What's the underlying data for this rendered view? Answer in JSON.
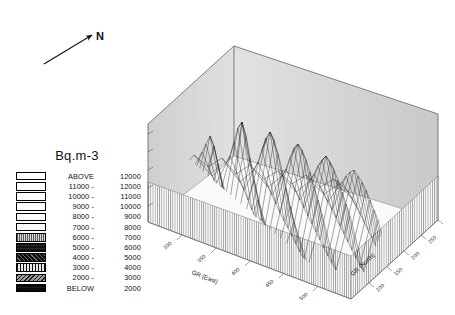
{
  "compass": {
    "label": "N",
    "icon": "north-arrow-icon"
  },
  "legend": {
    "title": "Bq.m-3",
    "rows": [
      {
        "lower": "ABOVE",
        "upper": "12000",
        "pattern": "p-0"
      },
      {
        "lower": "11000 -",
        "upper": "12000",
        "pattern": "p-1"
      },
      {
        "lower": "10000 -",
        "upper": "11000",
        "pattern": "p-2"
      },
      {
        "lower": "9000 -",
        "upper": "10000",
        "pattern": "p-3"
      },
      {
        "lower": "8000 -",
        "upper": "9000",
        "pattern": "p-4"
      },
      {
        "lower": "7000 -",
        "upper": "8000",
        "pattern": "p-5"
      },
      {
        "lower": "6000 -",
        "upper": "7000",
        "pattern": "p-6"
      },
      {
        "lower": "5000 -",
        "upper": "6000",
        "pattern": "p-7"
      },
      {
        "lower": "4000 -",
        "upper": "5000",
        "pattern": "p-8"
      },
      {
        "lower": "3000 -",
        "upper": "4000",
        "pattern": "p-9"
      },
      {
        "lower": "2000 -",
        "upper": "3000",
        "pattern": "p-10"
      },
      {
        "lower": "BELOW",
        "upper": "2000",
        "pattern": "p-11"
      }
    ]
  },
  "chart_data": {
    "type": "surface",
    "title": "",
    "xlabel": "GR (East)",
    "ylabel": "GR (North)",
    "zlabel": "Vol'n Rn (Bq.m-3)",
    "zlim": [
      0,
      13500
    ],
    "zticks": [
      "2500",
      "5000",
      "7500",
      "10000",
      "12500"
    ],
    "xticks": [
      "300",
      "350",
      "400",
      "450",
      "500",
      "550"
    ],
    "yticks": [
      "100",
      "150",
      "200",
      "250",
      "300",
      "350"
    ],
    "grid": true,
    "legend_position": "left",
    "units": "Bq.m-3",
    "surface_note": "Wireframe / mesh surface of volumetric radon concentration over a grid-referenced area, viewed in oblique 3D projection with shaded back walls and a dropped skirt to the base plane.",
    "peaks": [
      {
        "x": 430,
        "y": 230,
        "z": 13000
      },
      {
        "x": 505,
        "y": 195,
        "z": 11500
      },
      {
        "x": 355,
        "y": 280,
        "z": 10500
      },
      {
        "x": 470,
        "y": 300,
        "z": 9800
      },
      {
        "x": 390,
        "y": 160,
        "z": 9200
      },
      {
        "x": 320,
        "y": 250,
        "z": 8600
      }
    ]
  }
}
